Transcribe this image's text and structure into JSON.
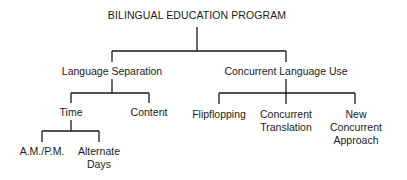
{
  "diagram": {
    "type": "tree",
    "root": {
      "label": "BILINGUAL EDUCATION PROGRAM",
      "children": [
        {
          "label": "Language Separation",
          "children": [
            {
              "label": "Time",
              "children": [
                {
                  "label": "A.M./P.M.",
                  "lines": [
                    "A.M./P.M."
                  ]
                },
                {
                  "label": "Alternate Days",
                  "lines": [
                    "Alternate",
                    "Days"
                  ]
                }
              ]
            },
            {
              "label": "Content",
              "lines": [
                "Content"
              ]
            }
          ]
        },
        {
          "label": "Concurrent Language Use",
          "children": [
            {
              "label": "Flipflopping",
              "lines": [
                "Flipflopping"
              ]
            },
            {
              "label": "Concurrent Translation",
              "lines": [
                "Concurrent",
                "Translation"
              ]
            },
            {
              "label": "New Concurrent Approach",
              "lines": [
                "New",
                "Concurrent",
                "Approach"
              ]
            }
          ]
        }
      ]
    }
  },
  "labels": {
    "root": "BILINGUAL EDUCATION PROGRAM",
    "language_separation": "Language Separation",
    "concurrent_language_use": "Concurrent Language Use",
    "time": "Time",
    "content": "Content",
    "am_pm": "A.M./P.M.",
    "alternate_days": [
      "Alternate",
      "Days"
    ],
    "flipflopping": "Flipflopping",
    "concurrent_translation": [
      "Concurrent",
      "Translation"
    ],
    "new_concurrent_approach": [
      "New",
      "Concurrent",
      "Approach"
    ]
  },
  "colors": {
    "line": "#1a1a1a",
    "text": "#1a1a1a",
    "background": "#ffffff"
  }
}
